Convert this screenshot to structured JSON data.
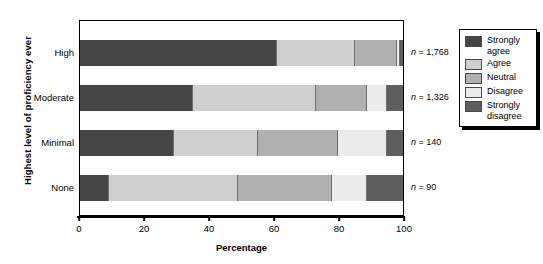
{
  "chart_data": {
    "type": "bar",
    "orientation": "horizontal",
    "stacked": true,
    "stacked_mode": "percent",
    "title": "",
    "xlabel": "Percentage",
    "ylabel": "Highest level of proficiency ever",
    "xlim": [
      0,
      100
    ],
    "xticks": [
      0,
      20,
      40,
      60,
      80,
      100
    ],
    "xtick_labels": [
      "0",
      "20",
      "40",
      "60",
      "80",
      "100"
    ],
    "grid": false,
    "legend_position": "right-outside",
    "categories": [
      "High",
      "Moderate",
      "Minimal",
      "None"
    ],
    "series": [
      {
        "name": "Strongly agree",
        "color": "#454545",
        "values": [
          61,
          35,
          29,
          9
        ]
      },
      {
        "name": "Agree",
        "color": "#cfcfcf",
        "values": [
          24,
          38,
          26,
          40
        ]
      },
      {
        "name": "Neutral",
        "color": "#b0b0b0",
        "values": [
          13,
          16,
          25,
          29
        ]
      },
      {
        "name": "Disagree",
        "color": "#ebebeb",
        "values": [
          1,
          6,
          15,
          11
        ]
      },
      {
        "name": "Strongly disagree",
        "color": "#5e5e5e",
        "values": [
          1,
          5,
          5,
          11
        ]
      }
    ],
    "annotations": [
      {
        "category": "High",
        "text": "n = 1,768",
        "n_value": "1,768"
      },
      {
        "category": "Moderate",
        "text": "n = 1,326",
        "n_value": "1,326"
      },
      {
        "category": "Minimal",
        "text": "n = 140",
        "n_value": "140"
      },
      {
        "category": "None",
        "text": "n = 90",
        "n_value": "90"
      }
    ]
  },
  "legend": {
    "items": [
      {
        "label": "Strongly\nagree",
        "color": "#454545"
      },
      {
        "label": "Agree",
        "color": "#cfcfcf"
      },
      {
        "label": "Neutral",
        "color": "#b0b0b0"
      },
      {
        "label": "Disagree",
        "color": "#ebebeb"
      },
      {
        "label": "Strongly\ndisagree",
        "color": "#5e5e5e"
      }
    ]
  },
  "colors": {
    "axis": "#000000",
    "background": "#ffffff",
    "segment_border": "#6f6f6f"
  }
}
